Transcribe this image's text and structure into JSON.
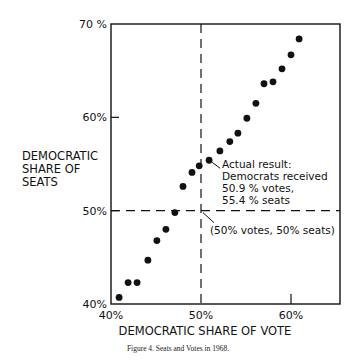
{
  "chart_data": {
    "type": "scatter",
    "title": "",
    "caption": "Figure 4. Seats and Votes in 1968.",
    "xlabel": "DEMOCRATIC SHARE OF VOTE",
    "ylabel_lines": [
      "DEMOCRATIC",
      "SHARE OF",
      "SEATS"
    ],
    "xlim": [
      40,
      65.5
    ],
    "ylim": [
      40,
      70
    ],
    "x_ticks": [
      {
        "value": 40,
        "label": "40%"
      },
      {
        "value": 50,
        "label": "50%"
      },
      {
        "value": 60,
        "label": "60%"
      }
    ],
    "y_ticks": [
      {
        "value": 40,
        "label": "40%"
      },
      {
        "value": 50,
        "label": "50%"
      },
      {
        "value": 60,
        "label": "60%"
      },
      {
        "value": 70,
        "label": "70 %"
      }
    ],
    "grid": false,
    "legend": null,
    "reference_lines": [
      {
        "orientation": "vertical",
        "value": 50,
        "style": "dashed"
      },
      {
        "orientation": "horizontal",
        "value": 50,
        "style": "dashed"
      }
    ],
    "points": [
      {
        "x": 40.9,
        "y": 40.7
      },
      {
        "x": 41.9,
        "y": 42.3
      },
      {
        "x": 42.9,
        "y": 42.3
      },
      {
        "x": 44.1,
        "y": 44.7
      },
      {
        "x": 45.1,
        "y": 46.8
      },
      {
        "x": 46.1,
        "y": 48.0
      },
      {
        "x": 47.1,
        "y": 49.8
      },
      {
        "x": 48.0,
        "y": 52.6
      },
      {
        "x": 49.0,
        "y": 54.1
      },
      {
        "x": 49.8,
        "y": 54.8
      },
      {
        "x": 50.9,
        "y": 55.4
      },
      {
        "x": 52.1,
        "y": 56.4
      },
      {
        "x": 53.2,
        "y": 57.4
      },
      {
        "x": 54.1,
        "y": 58.3
      },
      {
        "x": 55.1,
        "y": 59.9
      },
      {
        "x": 56.1,
        "y": 61.5
      },
      {
        "x": 57.0,
        "y": 63.6
      },
      {
        "x": 58.0,
        "y": 63.8
      },
      {
        "x": 59.0,
        "y": 65.2
      },
      {
        "x": 60.0,
        "y": 66.7
      },
      {
        "x": 60.9,
        "y": 68.4
      }
    ],
    "annotations": [
      {
        "target": {
          "x": 50.9,
          "y": 55.4
        },
        "lines": [
          "Actual result:",
          "Democrats received",
          "50.9 %  votes,",
          "55.4 %  seats"
        ]
      },
      {
        "target": {
          "x": 50,
          "y": 50
        },
        "lines": [
          "(50% votes, 50% seats)"
        ]
      }
    ]
  }
}
